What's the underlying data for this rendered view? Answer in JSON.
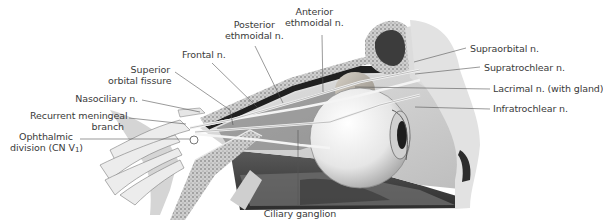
{
  "figure": {
    "colors": {
      "background": "#ffffff",
      "label_text": "#3a3a3a",
      "leader_line": "#555555",
      "bone_light": "#d9d9d9",
      "bone_dark": "#4a4a4a",
      "eyeball": "#e8e8e8",
      "nerve": "#f2f2f2"
    }
  },
  "labels": {
    "anterior_ethmoidal_1": "Anterior",
    "anterior_ethmoidal_2": "ethmoidal n.",
    "posterior_ethmoidal_1": "Posterior",
    "posterior_ethmoidal_2": "ethmoidal n.",
    "frontal": "Frontal n.",
    "superior_orbital_1": "Superior",
    "superior_orbital_2": "orbital fissure",
    "nasociliary": "Nasociliary n.",
    "recurrent_meningeal_1": "Recurrent meningeal",
    "recurrent_meningeal_2": "branch",
    "ophthalmic_1": "Ophthalmic",
    "ophthalmic_2": "division (CN V",
    "ophthalmic_sub": "1",
    "ophthalmic_3": ")",
    "supraorbital": "Supraorbital n.",
    "supratrochlear": "Supratrochlear n.",
    "lacrimal": "Lacrimal n. (with gland)",
    "infratrochlear": "Infratrochlear n.",
    "ciliary_ganglion": "Ciliary ganglion"
  }
}
